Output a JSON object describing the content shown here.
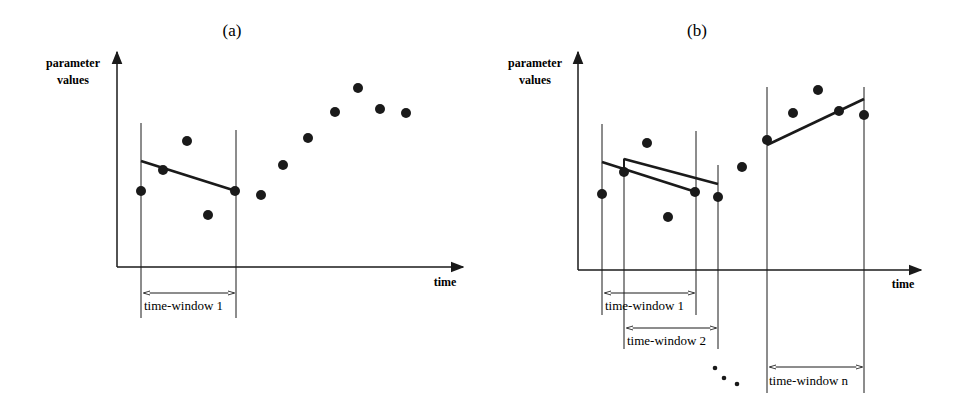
{
  "panels": [
    {
      "id": "a",
      "title": "(a)",
      "y_axis_label": [
        "parameter",
        "values"
      ],
      "x_axis_label": "time",
      "points": [
        [
          141,
          191
        ],
        [
          163,
          170
        ],
        [
          187,
          141
        ],
        [
          208,
          215
        ],
        [
          235,
          191
        ],
        [
          261,
          195
        ],
        [
          283,
          165
        ],
        [
          308,
          138
        ],
        [
          335,
          112
        ],
        [
          358,
          88
        ],
        [
          380,
          109
        ],
        [
          406,
          113
        ]
      ],
      "windows": [
        {
          "label": "time-window 1",
          "x1": 141,
          "x2": 236,
          "line_top_left": 123,
          "line_top_right": 130,
          "line_bottom": 318,
          "arrow_y": 293,
          "label_y": 310,
          "fit": [
            141,
            161,
            236,
            191
          ]
        }
      ]
    },
    {
      "id": "b",
      "title": "(b)",
      "y_axis_label": [
        "parameter",
        "values"
      ],
      "x_axis_label": "time",
      "points": [
        [
          602,
          194
        ],
        [
          624,
          172
        ],
        [
          647,
          143
        ],
        [
          668,
          217
        ],
        [
          695,
          192
        ],
        [
          718,
          197
        ],
        [
          742,
          167
        ],
        [
          767,
          140
        ],
        [
          793,
          113
        ],
        [
          818,
          90
        ],
        [
          839,
          111
        ],
        [
          864,
          115
        ]
      ],
      "windows": [
        {
          "label": "time-window 1",
          "x1": 602,
          "x2": 696,
          "line_top_left": 124,
          "line_top_right": 131,
          "line_bottom": 315,
          "arrow_y": 293,
          "label_y": 310,
          "fit": [
            602,
            162,
            696,
            192
          ]
        },
        {
          "label": "time-window 2",
          "x1": 624,
          "x2": 718,
          "line_top_left": 158,
          "line_top_right": 165,
          "line_bottom": 349,
          "arrow_y": 328,
          "label_y": 345,
          "fit": [
            624,
            159,
            718,
            184
          ]
        },
        {
          "label": "time-window n",
          "x1": 767,
          "x2": 864,
          "line_top_left": 87,
          "line_top_right": 87,
          "line_bottom": 393,
          "arrow_y": 367,
          "label_y": 385,
          "fit": [
            767,
            145,
            864,
            99
          ]
        }
      ],
      "ellipsis_dots": [
        [
          715,
          368
        ],
        [
          724,
          378
        ],
        [
          737,
          384
        ]
      ]
    }
  ],
  "labels": {
    "a_title": "(a)",
    "b_title": "(b)",
    "y_label_line1": "parameter",
    "y_label_line2": "values",
    "x_label": "time",
    "a_window1": "time-window 1",
    "b_window1": "time-window 1",
    "b_window2": "time-window 2",
    "b_windown": "time-window n"
  }
}
